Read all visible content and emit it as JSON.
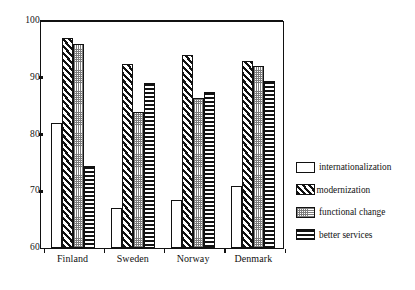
{
  "chart_data": {
    "type": "bar",
    "title": "",
    "subtitle": "",
    "xlabel": "",
    "ylabel": "",
    "ylim": [
      60,
      100
    ],
    "yticks": [
      60,
      70,
      80,
      90,
      100
    ],
    "grid": false,
    "legend_position": "right",
    "categories": [
      "Finland",
      "Sweden",
      "Norway",
      "Denmark"
    ],
    "series": [
      {
        "name": "internationalization",
        "pattern": "plain-white",
        "values": [
          82,
          67,
          68.5,
          71
        ]
      },
      {
        "name": "modernization",
        "pattern": "diagonal-hatch",
        "values": [
          97,
          92.5,
          94,
          93
        ]
      },
      {
        "name": "functional change",
        "pattern": "dotted-stipple",
        "values": [
          96,
          84,
          86.5,
          92
        ]
      },
      {
        "name": "better services",
        "pattern": "horizontal-stripes",
        "values": [
          74.5,
          89,
          87.5,
          89.5
        ]
      }
    ]
  },
  "axis": {
    "y_tick_labels": [
      "100",
      "90",
      "80",
      "70",
      "60"
    ]
  },
  "legend": {
    "items": [
      {
        "label": "internationalization"
      },
      {
        "label": "modernization"
      },
      {
        "label": "functional change"
      },
      {
        "label": "better services"
      }
    ]
  },
  "colors": {
    "ink": "#111111",
    "background": "#ffffff",
    "stipple": "#7d7d7d"
  }
}
